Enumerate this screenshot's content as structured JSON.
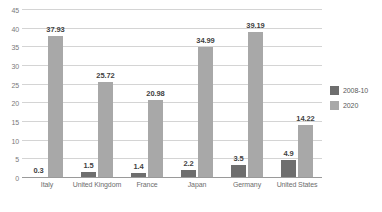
{
  "chart_data": {
    "type": "bar",
    "title": "",
    "subtitle": "",
    "xlabel": "",
    "ylabel": "",
    "ylim": [
      0,
      45
    ],
    "ytick_step": 5,
    "yticks": [
      "0",
      "5",
      "10",
      "15",
      "20",
      "25",
      "30",
      "35",
      "40",
      "45"
    ],
    "grid": true,
    "legend_position": "right",
    "categories": [
      "Italy",
      "United Kingdom",
      "France",
      "Japan",
      "Germany",
      "United States"
    ],
    "series": [
      {
        "name": "2008-10",
        "color": "#6e6e6e",
        "values": [
          0.3,
          1.5,
          1.4,
          2.2,
          3.5,
          4.9
        ],
        "labels": [
          "0.3",
          "1.5",
          "1.4",
          "2.2",
          "3.5",
          "4.9"
        ]
      },
      {
        "name": "2020",
        "color": "#a8a8a8",
        "values": [
          37.93,
          25.72,
          20.98,
          34.99,
          39.19,
          14.22
        ],
        "labels": [
          "37.93",
          "25.72",
          "20.98",
          "34.99",
          "39.19",
          "14.22"
        ]
      }
    ]
  },
  "colors": {
    "series_2008_10": "#6e6e6e",
    "series_2020": "#a8a8a8",
    "gridline": "#d4d4d4",
    "axis": "#9a9a9a",
    "tick_text": "#7a7a7a",
    "label_text": "#3f3f3f",
    "background": "#ffffff"
  }
}
